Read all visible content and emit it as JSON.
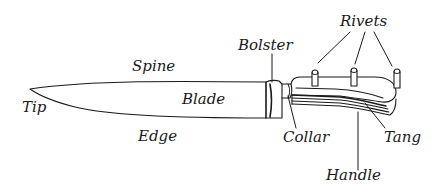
{
  "diagram": {
    "line_color": "#1a1a1a",
    "background": "#ffffff",
    "labels": {
      "tip": "Tip",
      "spine": "Spine",
      "blade": "Blade",
      "edge": "Edge",
      "bolster": "Bolster",
      "collar": "Collar",
      "rivets": "Rivets",
      "tang": "Tang",
      "handle": "Handle"
    }
  }
}
